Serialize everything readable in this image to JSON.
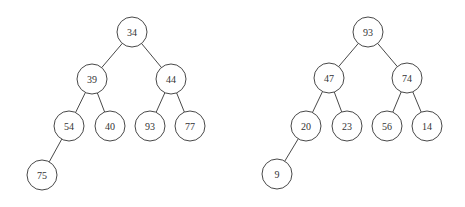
{
  "diagram": {
    "type": "binary-trees",
    "colors": {
      "stroke": "#333333",
      "fill": "#ffffff",
      "text": "#333333"
    },
    "node_radius": 15,
    "trees": [
      {
        "name": "left-tree",
        "nodes": [
          {
            "id": "L0",
            "label": "34",
            "x": 132,
            "y": 32
          },
          {
            "id": "L1",
            "label": "39",
            "x": 92,
            "y": 79
          },
          {
            "id": "L2",
            "label": "44",
            "x": 171,
            "y": 79
          },
          {
            "id": "L3",
            "label": "54",
            "x": 69,
            "y": 126
          },
          {
            "id": "L4",
            "label": "40",
            "x": 110,
            "y": 126
          },
          {
            "id": "L5",
            "label": "93",
            "x": 150,
            "y": 126
          },
          {
            "id": "L6",
            "label": "77",
            "x": 190,
            "y": 126
          },
          {
            "id": "L7",
            "label": "75",
            "x": 42,
            "y": 175
          }
        ],
        "edges": [
          [
            "L0",
            "L1"
          ],
          [
            "L0",
            "L2"
          ],
          [
            "L1",
            "L3"
          ],
          [
            "L1",
            "L4"
          ],
          [
            "L2",
            "L5"
          ],
          [
            "L2",
            "L6"
          ],
          [
            "L3",
            "L7"
          ]
        ]
      },
      {
        "name": "right-tree",
        "nodes": [
          {
            "id": "R0",
            "label": "93",
            "x": 368,
            "y": 32
          },
          {
            "id": "R1",
            "label": "47",
            "x": 329,
            "y": 78
          },
          {
            "id": "R2",
            "label": "74",
            "x": 407,
            "y": 78
          },
          {
            "id": "R3",
            "label": "20",
            "x": 306,
            "y": 126
          },
          {
            "id": "R4",
            "label": "23",
            "x": 347,
            "y": 126
          },
          {
            "id": "R5",
            "label": "56",
            "x": 387,
            "y": 126
          },
          {
            "id": "R6",
            "label": "14",
            "x": 427,
            "y": 126
          },
          {
            "id": "R7",
            "label": "9",
            "x": 277,
            "y": 174
          }
        ],
        "edges": [
          [
            "R0",
            "R1"
          ],
          [
            "R0",
            "R2"
          ],
          [
            "R1",
            "R3"
          ],
          [
            "R1",
            "R4"
          ],
          [
            "R2",
            "R5"
          ],
          [
            "R2",
            "R6"
          ],
          [
            "R3",
            "R7"
          ]
        ]
      }
    ]
  }
}
